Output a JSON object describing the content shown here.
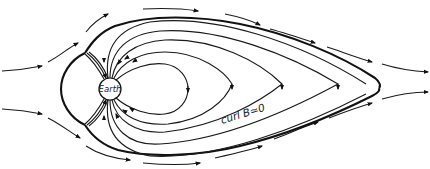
{
  "figure": {
    "labels": {
      "earth": "Earth",
      "tail_annotation": "curl B≃0"
    },
    "elements": [
      "solar-wind-flow-lines",
      "magnetopause-boundary",
      "closed-dipole-field-lines",
      "tail-field-lines",
      "cusp-field-lines"
    ],
    "line_color": "#1a1a1a",
    "background": "#ffffff"
  }
}
